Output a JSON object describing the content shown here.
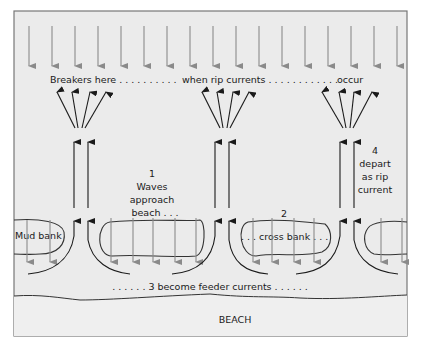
{
  "diagram": {
    "title_row": {
      "part1": "Breakers here . . . . . . . . . .",
      "part2": "when rip currents . . . . . . . . . . . .",
      "part3": "occur"
    },
    "steps": [
      {
        "number": "1",
        "lines": [
          "Waves",
          "approach",
          "beach . . ."
        ]
      },
      {
        "number": "2",
        "lines": [
          ". . . cross bank . . ."
        ]
      },
      {
        "number": "3",
        "lines": [
          ". . . . . . 3  become feeder currents . . . . . ."
        ]
      },
      {
        "number": "4",
        "lines": [
          "depart",
          "as rip",
          "current"
        ]
      }
    ],
    "labels": {
      "mud_bank": "Mud bank",
      "beach": "BEACH"
    },
    "colors": {
      "water_bg": "#ebebeb",
      "beach_bg": "#efefef",
      "frame": "#777777",
      "wave_arrow": "#8a8a8a",
      "rip_arrow": "#1a1a1a",
      "bank_outline": "#333333"
    },
    "elements": {
      "incoming_wave_arrows": 18,
      "rip_current_channels": 3,
      "mud_banks": 4
    }
  }
}
